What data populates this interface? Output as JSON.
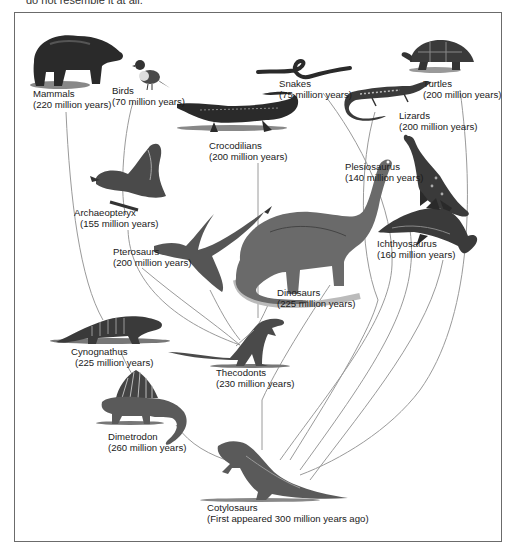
{
  "caption_top": "do not resemble it at all.",
  "diagram": {
    "colors": {
      "line": "#9a9a9a",
      "frame": "#6b6b6b",
      "ink": "#2a2a2a",
      "shade": "#7a7a7a"
    },
    "nodes": [
      {
        "id": "mammals",
        "name": "Mammals",
        "years": "(220 million years)",
        "icon": "bear-icon"
      },
      {
        "id": "birds",
        "name": "Birds",
        "years": "(70 million years)",
        "icon": "bird-icon"
      },
      {
        "id": "snakes",
        "name": "Snakes",
        "years": "(75 million years)",
        "icon": "snake-icon"
      },
      {
        "id": "turtles",
        "name": "Turtles",
        "years": "(200 million years)",
        "icon": "turtle-icon"
      },
      {
        "id": "lizards",
        "name": "Lizards",
        "years": "(200 million years)",
        "icon": "lizard-icon"
      },
      {
        "id": "crocodilians",
        "name": "Crocodilians",
        "years": "(200 million years)",
        "icon": "crocodile-icon"
      },
      {
        "id": "plesiosaurus",
        "name": "Plesiosaurus",
        "years": "(140 million years)",
        "icon": "plesiosaur-icon"
      },
      {
        "id": "archaeopteryx",
        "name": "Archaeopteryx",
        "years": "(155 million years)",
        "icon": "archaeopteryx-icon"
      },
      {
        "id": "pterosaurs",
        "name": "Pterosaurs",
        "years": "(200 million years)",
        "icon": "pterosaur-icon"
      },
      {
        "id": "ichthyosaurus",
        "name": "Ichthyosaurus",
        "years": "(160 million years)",
        "icon": "ichthyosaur-icon"
      },
      {
        "id": "dinosaurs",
        "name": "Dinosaurs",
        "years": "(225 million years)",
        "icon": "sauropod-icon"
      },
      {
        "id": "cynognathus",
        "name": "Cynognathus",
        "years": "(225 million years)",
        "icon": "cynognathus-icon"
      },
      {
        "id": "thecodonts",
        "name": "Thecodonts",
        "years": "(230 million years)",
        "icon": "thecodont-icon"
      },
      {
        "id": "dimetrodon",
        "name": "Dimetrodon",
        "years": "(260 million years)",
        "icon": "dimetrodon-icon"
      },
      {
        "id": "cotylosaurs",
        "name": "Cotylosaurs",
        "years": "(First appeared 300 million years ago)",
        "icon": "cotylosaur-icon"
      }
    ]
  }
}
